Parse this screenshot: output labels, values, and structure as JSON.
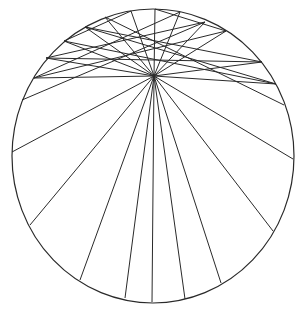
{
  "diagram": {
    "type": "geometric-line-construction",
    "stroke_color": "#2a2a2a",
    "background_color": "#ffffff",
    "circle": {
      "cx": 153,
      "cy": 156,
      "rx": 141,
      "ry": 147
    },
    "focal_point": {
      "x": 154,
      "y": 76
    },
    "rays_to_lower_arc": [
      {
        "x": 12,
        "y": 152
      },
      {
        "x": 30,
        "y": 225
      },
      {
        "x": 80,
        "y": 280
      },
      {
        "x": 125,
        "y": 298
      },
      {
        "x": 152,
        "y": 302
      },
      {
        "x": 185,
        "y": 299
      },
      {
        "x": 221,
        "y": 283
      },
      {
        "x": 273,
        "y": 231
      },
      {
        "x": 293,
        "y": 159
      }
    ],
    "rays_to_upper_arc": [
      {
        "x": 34,
        "y": 78
      },
      {
        "x": 85,
        "y": 27
      },
      {
        "x": 131,
        "y": 11
      },
      {
        "x": 155,
        "y": 9
      },
      {
        "x": 180,
        "y": 12
      },
      {
        "x": 226,
        "y": 31
      },
      {
        "x": 276,
        "y": 84
      }
    ],
    "upper_chords": [
      {
        "x1": 34,
        "y1": 78,
        "x2": 226,
        "y2": 31
      },
      {
        "x1": 46,
        "y1": 58,
        "x2": 262,
        "y2": 62
      },
      {
        "x1": 64,
        "y1": 41,
        "x2": 276,
        "y2": 84
      },
      {
        "x1": 85,
        "y1": 27,
        "x2": 262,
        "y2": 62
      },
      {
        "x1": 85,
        "y1": 27,
        "x2": 276,
        "y2": 84
      },
      {
        "x1": 46,
        "y1": 58,
        "x2": 205,
        "y2": 22
      },
      {
        "x1": 34,
        "y1": 78,
        "x2": 180,
        "y2": 12
      },
      {
        "x1": 64,
        "y1": 41,
        "x2": 131,
        "y2": 11
      },
      {
        "x1": 226,
        "y1": 31,
        "x2": 155,
        "y2": 9
      },
      {
        "x1": 22,
        "y1": 100,
        "x2": 205,
        "y2": 22
      },
      {
        "x1": 105,
        "y1": 17,
        "x2": 284,
        "y2": 105
      },
      {
        "x1": 105,
        "y1": 17,
        "x2": 154,
        "y2": 76
      },
      {
        "x1": 205,
        "y1": 22,
        "x2": 154,
        "y2": 76
      },
      {
        "x1": 64,
        "y1": 41,
        "x2": 154,
        "y2": 76
      },
      {
        "x1": 262,
        "y1": 62,
        "x2": 154,
        "y2": 76
      },
      {
        "x1": 46,
        "y1": 58,
        "x2": 154,
        "y2": 76
      }
    ]
  }
}
